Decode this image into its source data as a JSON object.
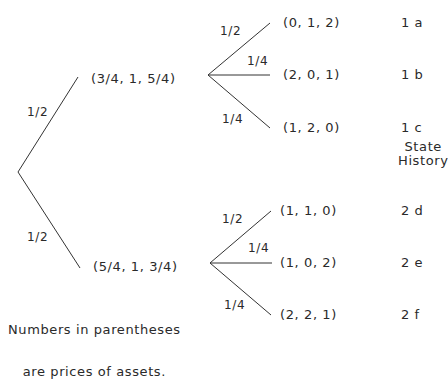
{
  "diagram": {
    "type": "probability-tree",
    "root": {
      "branches": [
        {
          "prob": "1/2",
          "node": "(3/4, 1, 5/4)",
          "state": "1",
          "children": [
            {
              "prob": "1/2",
              "prices": "(0, 1, 2)",
              "history": "1 a"
            },
            {
              "prob": "1/4",
              "prices": "(2, 0, 1)",
              "history": "1 b"
            },
            {
              "prob": "1/4",
              "prices": "(1, 2, 0)",
              "history": "1 c"
            }
          ]
        },
        {
          "prob": "1/2",
          "node": "(5/4, 1, 3/4)",
          "state": "2",
          "children": [
            {
              "prob": "1/2",
              "prices": "(1, 1, 0)",
              "history": "2 d"
            },
            {
              "prob": "1/4",
              "prices": "(1, 0, 2)",
              "history": "2 e"
            },
            {
              "prob": "1/4",
              "prices": "(2, 2, 1)",
              "history": "2 f"
            }
          ]
        }
      ]
    },
    "column_header": {
      "line1": "State",
      "line2": "History"
    },
    "note": {
      "line1": "Numbers in parentheses",
      "line2": "are prices of assets."
    },
    "colors": {
      "line": "#333333",
      "text": "#2a2a2a",
      "background": "#ffffff"
    }
  }
}
